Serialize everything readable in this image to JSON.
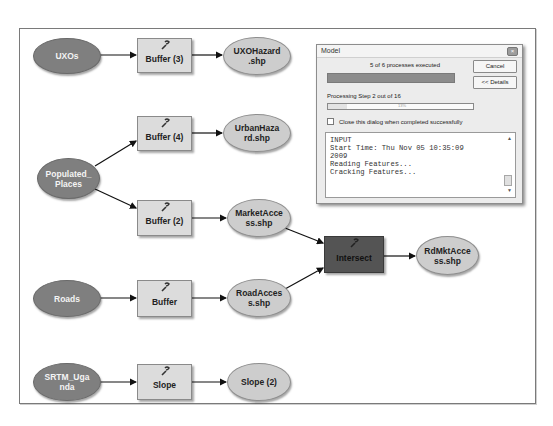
{
  "model": {
    "nodes": {
      "uxos": {
        "label": "UXOs",
        "type": "input-data"
      },
      "buffer3": {
        "label": "Buffer (3)",
        "type": "tool",
        "icon": "wrench-icon"
      },
      "uxohazard": {
        "label": "UXOHazard .shp",
        "type": "output-data"
      },
      "buffer4": {
        "label": "Buffer (4)",
        "type": "tool",
        "icon": "wrench-icon"
      },
      "urbanhazard": {
        "label": "UrbanHaza rd.shp",
        "type": "output-data"
      },
      "populated_places": {
        "label": "Populated_ Places",
        "type": "input-data"
      },
      "buffer2": {
        "label": "Buffer (2)",
        "type": "tool",
        "icon": "wrench-icon"
      },
      "marketaccess": {
        "label": "MarketAcce ss.shp",
        "type": "output-data"
      },
      "intersect": {
        "label": "Intersect",
        "type": "tool",
        "state": "active",
        "icon": "wrench-icon"
      },
      "rdmktaccess": {
        "label": "RdMktAcce ss.shp",
        "type": "output-data"
      },
      "roads": {
        "label": "Roads",
        "type": "input-data"
      },
      "buffer": {
        "label": "Buffer",
        "type": "tool",
        "icon": "wrench-icon"
      },
      "roadaccess": {
        "label": "RoadAcces s.shp",
        "type": "output-data"
      },
      "srtm_uganda": {
        "label": "SRTM_Uga nda",
        "type": "input-data"
      },
      "slope": {
        "label": "Slope",
        "type": "tool",
        "icon": "wrench-icon"
      },
      "slope2": {
        "label": "Slope (2)",
        "type": "output-data"
      }
    },
    "colors": {
      "input_fill": "#7f7f7f",
      "output_fill": "#cdcdcd",
      "tool_fill": "#dcdcdc",
      "active_tool_fill": "#545454"
    }
  },
  "dialog": {
    "title": "Model",
    "close_icon": "close-icon",
    "status": "5 of 6 processes executed",
    "cancel_label": "Cancel",
    "details_label": "<< Details",
    "step_text": "Processing Step 2 out of 16",
    "step_progress_text": "13%",
    "close_checkbox_label": "Close this dialog when completed successfully",
    "close_checkbox_checked": false,
    "log_lines": [
      "INPUT",
      "Start Time: Thu Nov 05 10:35:09",
      "2009",
      "Reading Features...",
      "Cracking Features..."
    ]
  }
}
